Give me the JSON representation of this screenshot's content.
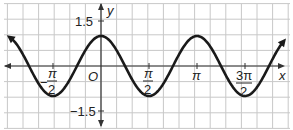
{
  "chart_data": {
    "type": "line",
    "function": "y = cos(2x)",
    "title": "",
    "xlabel": "x",
    "ylabel": "y",
    "origin_label": "O",
    "x_tick_labels": [
      "-π/2",
      "π/2",
      "π",
      "3π/2"
    ],
    "x_tick_values": [
      -1.5708,
      1.5708,
      3.1416,
      4.7124
    ],
    "y_tick_labels": [
      "1.5",
      "-1.5"
    ],
    "y_tick_values": [
      1.5,
      -1.5
    ],
    "xlim": [
      -3.3,
      6.2
    ],
    "ylim": [
      -2.0,
      2.0
    ],
    "grid": true,
    "amplitude": 1,
    "period": 3.1416,
    "series": [
      {
        "name": "cos(2x)",
        "x": [
          -3.1416,
          -2.3562,
          -1.5708,
          -0.7854,
          0,
          0.7854,
          1.5708,
          2.3562,
          3.1416,
          3.927,
          4.7124,
          5.4978,
          6.2832
        ],
        "values": [
          1,
          0,
          -1,
          0,
          1,
          0,
          -1,
          0,
          1,
          0,
          -1,
          0,
          1
        ]
      }
    ]
  },
  "labels": {
    "y_axis": "y",
    "x_axis": "x",
    "origin": "O",
    "y_pos": "1.5",
    "y_neg": "−1.5",
    "neg_pi_half_num": "π",
    "neg_pi_half_den": "2",
    "neg_sign": "−",
    "pi_half_num": "π",
    "pi_half_den": "2",
    "pi": "π",
    "three_pi_half_num": "3π",
    "three_pi_half_den": "2"
  }
}
